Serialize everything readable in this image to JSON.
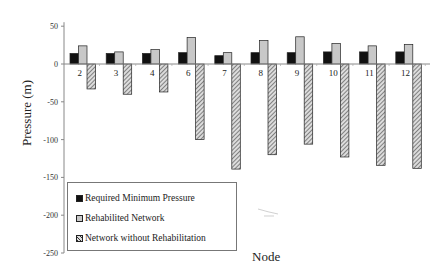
{
  "chart_data": {
    "type": "bar",
    "title": "",
    "xlabel": "Node",
    "ylabel": "Pressure (m)",
    "ylim": [
      -250,
      50
    ],
    "yticks": [
      50,
      0,
      -50,
      -100,
      -150,
      -200,
      -250
    ],
    "grid": false,
    "legend_position": "lower-left inside",
    "categories": [
      "2",
      "3",
      "4",
      "6",
      "7",
      "8",
      "9",
      "10",
      "11",
      "12"
    ],
    "series": [
      {
        "name": "Required Minimum Pressure",
        "color": "#111111",
        "pattern": "solid",
        "values": [
          14,
          14,
          14,
          15,
          11,
          15,
          15,
          16,
          16,
          16
        ]
      },
      {
        "name": "Rehabilited Network",
        "color": "#c8c8c8",
        "pattern": "solid",
        "values": [
          24,
          16,
          19,
          35,
          15,
          31,
          36,
          27,
          24,
          26
        ]
      },
      {
        "name": "Network without Rehabilitation",
        "color": "#999999",
        "pattern": "hatched",
        "values": [
          -33,
          -40,
          -37,
          -100,
          -139,
          -120,
          -106,
          -123,
          -134,
          -138
        ]
      }
    ]
  },
  "legend": {
    "items": [
      {
        "label": "Required Minimum Pressure"
      },
      {
        "label": "Rehabilited Network"
      },
      {
        "label": "Network without Rehabilitation"
      }
    ]
  },
  "axes": {
    "x_title": "Node",
    "y_title": "Pressure (m)"
  }
}
